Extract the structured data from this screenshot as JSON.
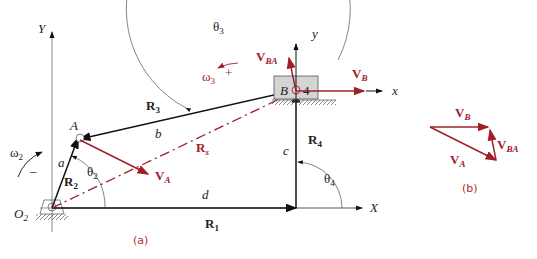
{
  "figure": {
    "part_a": {
      "caption": "(a)",
      "axes": {
        "X": "X",
        "Y": "Y",
        "x_local": "x",
        "y_local": "y"
      },
      "points": {
        "O2": "O",
        "O2_sub": "2",
        "A": "A",
        "B": "B",
        "slider_number": "4"
      },
      "vectors": {
        "R1": {
          "base": "R",
          "sub": "1",
          "length_label": "d"
        },
        "R2": {
          "base": "R",
          "sub": "2",
          "length_label": "a"
        },
        "R3": {
          "base": "R",
          "sub": "3",
          "length_label": "b"
        },
        "R4": {
          "base": "R",
          "sub": "4",
          "length_label": "c"
        },
        "Rs": {
          "base": "R",
          "sub": "s"
        }
      },
      "angles": {
        "theta2": {
          "base": "θ",
          "sub": "2"
        },
        "theta3": {
          "base": "θ",
          "sub": "3"
        },
        "theta4": {
          "base": "θ",
          "sub": "4"
        }
      },
      "angular_velocities": {
        "omega2": {
          "base": "ω",
          "sub": "2",
          "sign": "–"
        },
        "omega3": {
          "base": "ω",
          "sub": "3",
          "sign": "+"
        }
      },
      "velocities": {
        "VA": {
          "base": "V",
          "sub": "A"
        },
        "VB": {
          "base": "V",
          "sub": "B"
        },
        "VBA": {
          "base": "V",
          "sub": "BA"
        }
      }
    },
    "part_b": {
      "caption": "(b)",
      "velocities": {
        "VA": {
          "base": "V",
          "sub": "A"
        },
        "VB": {
          "base": "V",
          "sub": "B"
        },
        "VBA": {
          "base": "V",
          "sub": "BA"
        }
      }
    },
    "colors": {
      "link": "#111111",
      "velocity": "#a0202a",
      "axis": "#888888",
      "slider_fill": "#d4d4d4"
    }
  }
}
